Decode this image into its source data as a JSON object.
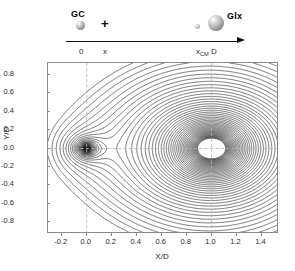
{
  "figure": {
    "schematic": {
      "body_left": {
        "label": "GC",
        "icon": "sphere-small-icon"
      },
      "operator": "+",
      "body_right": {
        "label": "Glx",
        "icon": "sphere-large-icon"
      },
      "satellite_dot": {
        "icon": "sphere-tiny-icon"
      },
      "axis_arrow": {
        "icon": "right-arrow-icon"
      },
      "position_ticks": [
        {
          "label": "0",
          "sub": ""
        },
        {
          "label": "x",
          "sub": ""
        },
        {
          "label": "x",
          "sub": "CM",
          "suffix": " D"
        }
      ],
      "tick_0": "0",
      "tick_x": "x",
      "tick_xcm_base": "x",
      "tick_xcm_sub": "CM",
      "tick_xcm_suffix": "D"
    },
    "colors": {
      "contour": "#1a1a1a",
      "guide_dashed": "#b0b0b0",
      "frame": "#8a8a8a",
      "text": "#2a2a2a"
    }
  },
  "chart_data": {
    "type": "contour",
    "title": "",
    "xlabel": "X/D",
    "ylabel": "Y/D",
    "xlim": [
      -0.31,
      1.54
    ],
    "ylim": [
      -0.93,
      0.93
    ],
    "xticks": [
      -0.2,
      0.0,
      0.2,
      0.4,
      0.6,
      0.8,
      1.0,
      1.2,
      1.4
    ],
    "xticklabels": [
      "-0.2",
      "0.0",
      "0.2",
      "0.4",
      "0.6",
      "0.8",
      "1.0",
      "1.2",
      "1.4"
    ],
    "yticks": [
      0.8,
      0.6,
      0.4,
      0.2,
      0.0,
      -0.2,
      -0.4,
      -0.6,
      -0.8
    ],
    "yticklabels": [
      "0.8",
      "0.6",
      "0.4",
      "0.2",
      "0.0",
      "-0.2",
      "-0.4",
      "-0.6",
      "-0.8"
    ],
    "grid": false,
    "legend": "none",
    "masses": [
      {
        "name": "GC",
        "x": 0.0,
        "y": 0.0,
        "relative_mass": 0.06
      },
      {
        "name": "Glx",
        "x": 1.0,
        "y": 0.0,
        "relative_mass": 1.0
      }
    ],
    "saddle_point": {
      "x": 0.42,
      "y": 0.0,
      "label": "L1"
    },
    "guide_lines": [
      {
        "orientation": "vertical",
        "value": 0.0
      },
      {
        "orientation": "vertical",
        "value": 1.0
      },
      {
        "orientation": "horizontal",
        "value": 0.0
      }
    ],
    "n_contour_levels": 46
  }
}
